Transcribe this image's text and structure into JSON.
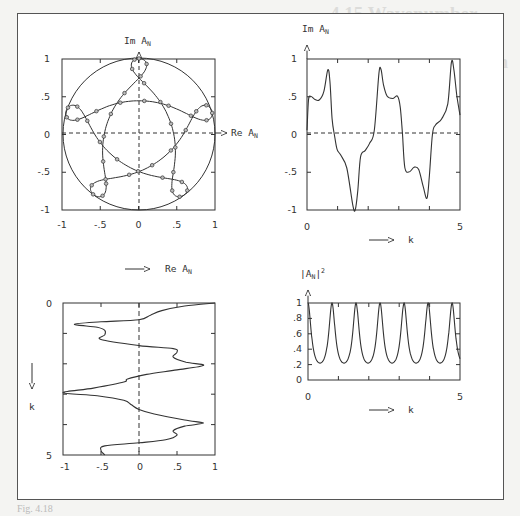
{
  "background": {
    "heading_line1": "4.15 Wavenumber Reflection",
    "heading_line2": "and Argand Diagram for a Thin Wire"
  },
  "caption": "Fig. 4.18",
  "panels": {
    "argand": {
      "ylabel": "Im  A",
      "ysub": "N",
      "xlabel": "Re  A",
      "xsub": "N"
    },
    "im_vs_k": {
      "ylabel": "Im  A",
      "ysub": "N",
      "xlabel": "k"
    },
    "re_vs_k": {
      "xlabel": "Re  A",
      "xsub": "N",
      "ylabel": "k"
    },
    "abs2_vs_k": {
      "ylabel": "|A",
      "ysub": "N",
      "ysup": "2",
      "yclose": "|",
      "xlabel": "k"
    }
  },
  "chart_data": [
    {
      "type": "scatter",
      "title": "Argand diagram",
      "xlabel": "Re A_N",
      "ylabel": "Im A_N",
      "xlim": [
        -1,
        1
      ],
      "ylim": [
        -1,
        1
      ],
      "xticks": [
        "-1",
        "-.5",
        "0",
        ".5",
        "1"
      ],
      "yticks": [
        "1",
        ".5",
        "0",
        "-.5",
        "-1"
      ],
      "unit_circle": true,
      "note": "Five-petal rosette curve inscribed in unit circle, with circular markers along the curve; dashed axes through origin"
    },
    {
      "type": "line",
      "title": "Im A_N vs k",
      "xlabel": "k",
      "ylabel": "Im A_N",
      "xlim": [
        0,
        5
      ],
      "ylim": [
        -1,
        1
      ],
      "xticks": [
        "0",
        "5"
      ],
      "yticks": [
        "1",
        ".5",
        "0",
        "-.5",
        "-1"
      ],
      "x": [
        0,
        0.05,
        0.12,
        0.25,
        0.4,
        0.55,
        0.68,
        0.75,
        0.82,
        0.9,
        0.98,
        1.1,
        1.3,
        1.5,
        1.58,
        1.66,
        1.75,
        1.9,
        2.05,
        2.2,
        2.35,
        2.42,
        2.5,
        2.62,
        2.8,
        2.96,
        3.05,
        3.12,
        3.2,
        3.35,
        3.5,
        3.65,
        3.8,
        3.92,
        4.0,
        4.1,
        4.2,
        4.4,
        4.6,
        4.72,
        4.8,
        4.9,
        5.0
      ],
      "values": [
        0.05,
        0.45,
        0.5,
        0.46,
        0.45,
        0.56,
        0.85,
        0.7,
        0.2,
        -0.02,
        -0.2,
        -0.28,
        -0.45,
        -0.95,
        -1.0,
        -0.75,
        -0.3,
        -0.22,
        -0.12,
        0.05,
        0.8,
        0.85,
        0.65,
        0.5,
        0.47,
        0.5,
        0.35,
        0.0,
        -0.45,
        -0.5,
        -0.44,
        -0.47,
        -0.7,
        -0.85,
        -0.55,
        0.0,
        0.12,
        0.2,
        0.4,
        0.95,
        0.85,
        0.5,
        0.25
      ]
    },
    {
      "type": "line",
      "title": "Re A_N vs k (k downward)",
      "xlabel": "Re A_N",
      "ylabel": "k",
      "xlim": [
        -1,
        1
      ],
      "ylim": [
        0,
        5
      ],
      "xticks": [
        "-1",
        "-.5",
        "0",
        ".5",
        "1"
      ],
      "yticks": [
        "0",
        "5"
      ],
      "k": [
        0,
        0.1,
        0.25,
        0.4,
        0.55,
        0.62,
        0.7,
        0.8,
        0.9,
        1.05,
        1.2,
        1.4,
        1.5,
        1.62,
        1.78,
        1.95,
        2.05,
        2.2,
        2.35,
        2.5,
        2.6,
        2.8,
        2.95,
        3.05,
        3.2,
        3.35,
        3.5,
        3.65,
        3.85,
        3.95,
        4.05,
        4.2,
        4.35,
        4.5,
        4.6,
        4.7,
        4.85,
        5.0
      ],
      "values": [
        1.0,
        0.6,
        0.3,
        0.15,
        0.0,
        -0.5,
        -0.85,
        -0.55,
        -0.45,
        -0.45,
        -0.5,
        0.0,
        0.45,
        0.5,
        0.45,
        0.62,
        0.85,
        0.5,
        0.1,
        -0.15,
        -0.2,
        -0.6,
        -1.0,
        -0.55,
        -0.2,
        -0.1,
        0.0,
        0.2,
        0.6,
        0.85,
        0.6,
        0.45,
        0.5,
        0.35,
        0.0,
        -0.45,
        -0.5,
        -0.45
      ]
    },
    {
      "type": "line",
      "title": "|A_N|^2 vs k",
      "xlabel": "k",
      "ylabel": "|A_N|^2",
      "xlim": [
        0,
        5
      ],
      "ylim": [
        0,
        1
      ],
      "xticks": [
        "0",
        "5"
      ],
      "yticks": [
        "1",
        ".8",
        ".6",
        ".4",
        ".2",
        "0"
      ],
      "peaks_k": [
        0.0,
        0.79,
        1.58,
        2.37,
        3.16,
        3.95,
        4.74
      ],
      "peak_value": 1.0,
      "min_value": 0.22,
      "period": 0.79
    }
  ]
}
